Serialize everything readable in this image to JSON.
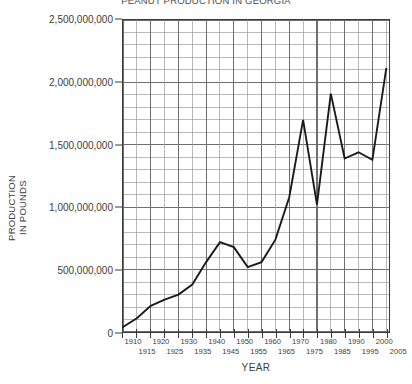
{
  "chart_data": {
    "type": "line",
    "title": "PEANUT PRODUCTION IN GEORGIA",
    "xlabel": "YEAR",
    "ylabel": "PRODUCTION IN POUNDS",
    "ylabel_line1": "PRODUCTION",
    "ylabel_line2": "IN POUNDS",
    "xlim": [
      1910,
      2006
    ],
    "ylim": [
      0,
      2500000000
    ],
    "grid": true,
    "grid_major_y_step": 500000000,
    "grid_minor_y_step": 100000000,
    "grid_major_x_step": 10,
    "grid_minor_x_step": 5,
    "legend": "none",
    "line_color": "#1a1a1a",
    "grid_color": "#6e6e6e",
    "minor_grid_color": "#9a9a9a",
    "axis_color": "#3a3a3a",
    "y_ticks": [
      {
        "value": 0,
        "label": "0"
      },
      {
        "value": 500000000,
        "label": "500,000,000"
      },
      {
        "value": 1000000000,
        "label": "1,000,000,000"
      },
      {
        "value": 1500000000,
        "label": "1,500,000,000"
      },
      {
        "value": 2000000000,
        "label": "2,000,000,000"
      },
      {
        "value": 2500000000,
        "label": "2,500,000,000"
      }
    ],
    "x_ticks": [
      {
        "value": 1910,
        "label": "1910",
        "row": "top"
      },
      {
        "value": 1915,
        "label": "1915",
        "row": "bottom"
      },
      {
        "value": 1920,
        "label": "1920",
        "row": "top"
      },
      {
        "value": 1925,
        "label": "1925",
        "row": "bottom"
      },
      {
        "value": 1930,
        "label": "1930",
        "row": "top"
      },
      {
        "value": 1935,
        "label": "1935",
        "row": "bottom"
      },
      {
        "value": 1940,
        "label": "1940",
        "row": "top"
      },
      {
        "value": 1945,
        "label": "1945",
        "row": "bottom"
      },
      {
        "value": 1950,
        "label": "1950",
        "row": "top"
      },
      {
        "value": 1955,
        "label": "1955",
        "row": "bottom"
      },
      {
        "value": 1960,
        "label": "1960",
        "row": "top"
      },
      {
        "value": 1965,
        "label": "1965",
        "row": "bottom"
      },
      {
        "value": 1970,
        "label": "1970",
        "row": "top"
      },
      {
        "value": 1975,
        "label": "1975",
        "row": "bottom"
      },
      {
        "value": 1980,
        "label": "1980",
        "row": "top"
      },
      {
        "value": 1985,
        "label": "1985",
        "row": "bottom"
      },
      {
        "value": 1990,
        "label": "1990",
        "row": "top"
      },
      {
        "value": 1995,
        "label": "1995",
        "row": "bottom"
      },
      {
        "value": 2000,
        "label": "2000",
        "row": "top"
      },
      {
        "value": 2005,
        "label": "2005",
        "row": "bottom"
      }
    ],
    "x": [
      1910,
      1915,
      1920,
      1925,
      1930,
      1935,
      1940,
      1945,
      1950,
      1955,
      1960,
      1965,
      1970,
      1975,
      1980,
      1985,
      1990,
      1995,
      2000,
      2005
    ],
    "values": [
      40000000,
      110000000,
      210000000,
      260000000,
      300000000,
      380000000,
      560000000,
      720000000,
      680000000,
      520000000,
      560000000,
      740000000,
      1080000000,
      1700000000,
      1020000000,
      1910000000,
      1390000000,
      1440000000,
      1380000000,
      2110000000
    ],
    "series": [
      {
        "name": "Peanut production",
        "points": [
          {
            "x": 1910,
            "y": 40000000
          },
          {
            "x": 1915,
            "y": 110000000
          },
          {
            "x": 1920,
            "y": 210000000
          },
          {
            "x": 1925,
            "y": 260000000
          },
          {
            "x": 1930,
            "y": 300000000
          },
          {
            "x": 1935,
            "y": 380000000
          },
          {
            "x": 1940,
            "y": 560000000
          },
          {
            "x": 1945,
            "y": 720000000
          },
          {
            "x": 1950,
            "y": 680000000
          },
          {
            "x": 1955,
            "y": 520000000
          },
          {
            "x": 1960,
            "y": 560000000
          },
          {
            "x": 1965,
            "y": 740000000
          },
          {
            "x": 1970,
            "y": 1080000000
          },
          {
            "x": 1975,
            "y": 1700000000
          },
          {
            "x": 1980,
            "y": 1020000000
          },
          {
            "x": 1985,
            "y": 1910000000
          },
          {
            "x": 1990,
            "y": 1390000000
          },
          {
            "x": 1995,
            "y": 1440000000
          },
          {
            "x": 2000,
            "y": 1380000000
          },
          {
            "x": 2005,
            "y": 2110000000
          }
        ]
      }
    ]
  }
}
